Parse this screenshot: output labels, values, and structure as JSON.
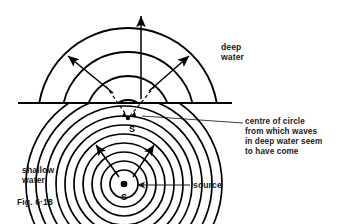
{
  "figure": {
    "number": "Fig. 6·18"
  },
  "labels": {
    "deep_water": "deep\nwater",
    "shallow_water": "shallow\nwater",
    "annotation": "centre of circle\nfrom which waves\nin deep water seem\nto have come",
    "source": "source",
    "virtual_source_marker": "S",
    "real_source_marker": "S"
  },
  "colors": {
    "ink": "#1a1a1a",
    "line": "#000000",
    "background": "#ffffff"
  },
  "geometry": {
    "boundary_line": {
      "x1": 18,
      "y1": 103,
      "x2": 232,
      "y2": 103
    },
    "real_source": {
      "x": 124,
      "y": 184
    },
    "virtual_source": {
      "x": 128,
      "y": 118
    },
    "shallow_arc_radii": [
      14,
      23,
      32,
      41,
      50,
      59,
      68,
      78,
      88,
      98
    ],
    "deep_arc_radii": [
      18,
      42,
      66,
      90
    ],
    "shallow_arc_count": 10,
    "deep_arc_count": 4
  },
  "arrows": {
    "vertical_deep": {
      "x1": 141,
      "y1": 99,
      "x2": 141,
      "y2": 14
    },
    "deep_left": {
      "x1": 112,
      "y1": 92,
      "x2": 67,
      "y2": 55
    },
    "deep_right": {
      "x1": 150,
      "y1": 90,
      "x2": 190,
      "y2": 55
    },
    "shallow_left": {
      "x1": 118,
      "y1": 176,
      "x2": 95,
      "y2": 143
    },
    "shallow_right": {
      "x1": 134,
      "y1": 176,
      "x2": 155,
      "y2": 143
    },
    "dashed_left": {
      "x1": 128,
      "y1": 118,
      "x2": 106,
      "y2": 86
    },
    "dashed_right": {
      "x1": 128,
      "y1": 118,
      "x2": 155,
      "y2": 86
    },
    "source_pointer": {
      "x1": 190,
      "y1": 185,
      "x2": 137,
      "y2": 185
    },
    "annotation_leader": {
      "x1": 243,
      "y1": 123,
      "x2": 140,
      "y2": 116
    }
  }
}
